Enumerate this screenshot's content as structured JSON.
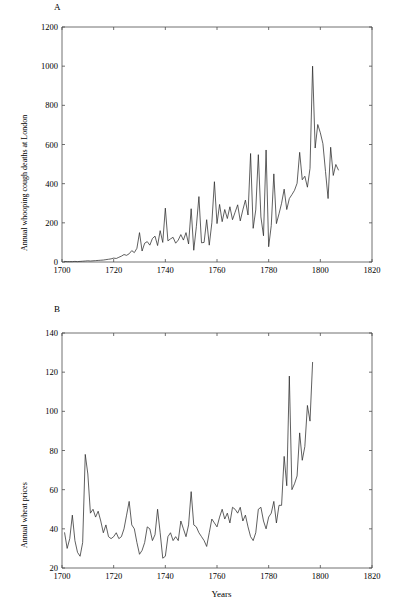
{
  "figure": {
    "background": "#ffffff",
    "line_color": "#2b2b2b",
    "axis_color": "#4d4d4d"
  },
  "panels": {
    "a": {
      "letter": "A"
    },
    "b": {
      "letter": "B"
    }
  },
  "chart_data": [
    {
      "type": "line",
      "panel": "A",
      "title": "",
      "xlabel": "",
      "ylabel": "Annual whooping cough deaths at London",
      "xlim": [
        1700,
        1820
      ],
      "ylim": [
        0,
        1200
      ],
      "xticks": [
        1700,
        1720,
        1740,
        1760,
        1780,
        1800,
        1820
      ],
      "yticks": [
        0,
        200,
        400,
        600,
        800,
        1000,
        1200
      ],
      "grid": false,
      "legend": "none",
      "x": [
        1701,
        1702,
        1703,
        1704,
        1705,
        1706,
        1707,
        1708,
        1709,
        1710,
        1711,
        1712,
        1713,
        1714,
        1715,
        1716,
        1717,
        1718,
        1719,
        1720,
        1721,
        1722,
        1723,
        1724,
        1725,
        1726,
        1727,
        1728,
        1729,
        1730,
        1731,
        1732,
        1733,
        1734,
        1735,
        1736,
        1737,
        1738,
        1739,
        1740,
        1741,
        1742,
        1743,
        1744,
        1745,
        1746,
        1747,
        1748,
        1749,
        1750,
        1751,
        1752,
        1753,
        1754,
        1755,
        1756,
        1757,
        1758,
        1759,
        1760,
        1761,
        1762,
        1763,
        1764,
        1765,
        1766,
        1767,
        1768,
        1769,
        1770,
        1771,
        1772,
        1773,
        1774,
        1775,
        1776,
        1777,
        1778,
        1779,
        1780,
        1781,
        1782,
        1783,
        1784,
        1785,
        1786,
        1787,
        1788,
        1789,
        1790,
        1791,
        1792,
        1793,
        1794,
        1795,
        1796,
        1797,
        1798,
        1799,
        1800,
        1801,
        1802,
        1803,
        1804,
        1805,
        1806,
        1807,
        1808,
        1809,
        1810,
        1811,
        1812
      ],
      "y": [
        3,
        2,
        2,
        2,
        3,
        2,
        3,
        4,
        5,
        6,
        5,
        6,
        7,
        8,
        9,
        10,
        12,
        14,
        16,
        20,
        18,
        24,
        30,
        38,
        34,
        42,
        58,
        48,
        70,
        150,
        56,
        96,
        104,
        86,
        120,
        132,
        84,
        160,
        100,
        275,
        108,
        118,
        126,
        96,
        112,
        140,
        112,
        150,
        92,
        272,
        60,
        180,
        334,
        98,
        100,
        216,
        86,
        200,
        410,
        196,
        294,
        206,
        268,
        222,
        282,
        216,
        254,
        292,
        210,
        266,
        316,
        240,
        554,
        172,
        266,
        548,
        230,
        134,
        572,
        78,
        186,
        450,
        196,
        246,
        300,
        372,
        268,
        324,
        344,
        366,
        402,
        560,
        420,
        438,
        382,
        478,
        1000,
        582,
        702,
        660,
        604,
        462,
        324,
        586,
        442,
        498,
        470,
        0,
        0,
        0,
        0,
        0
      ]
    },
    {
      "type": "line",
      "panel": "B",
      "title": "",
      "xlabel": "Years",
      "ylabel": "Annual wheat prices",
      "xlim": [
        1700,
        1820
      ],
      "ylim": [
        20,
        140
      ],
      "xticks": [
        1700,
        1720,
        1740,
        1760,
        1780,
        1800,
        1820
      ],
      "yticks": [
        20,
        40,
        60,
        80,
        100,
        120,
        140
      ],
      "grid": false,
      "legend": "none",
      "x": [
        1701,
        1702,
        1703,
        1704,
        1705,
        1706,
        1707,
        1708,
        1709,
        1710,
        1711,
        1712,
        1713,
        1714,
        1715,
        1716,
        1717,
        1718,
        1719,
        1720,
        1721,
        1722,
        1723,
        1724,
        1725,
        1726,
        1727,
        1728,
        1729,
        1730,
        1731,
        1732,
        1733,
        1734,
        1735,
        1736,
        1737,
        1738,
        1739,
        1740,
        1741,
        1742,
        1743,
        1744,
        1745,
        1746,
        1747,
        1748,
        1749,
        1750,
        1751,
        1752,
        1753,
        1754,
        1755,
        1756,
        1757,
        1758,
        1759,
        1760,
        1761,
        1762,
        1763,
        1764,
        1765,
        1766,
        1767,
        1768,
        1769,
        1770,
        1771,
        1772,
        1773,
        1774,
        1775,
        1776,
        1777,
        1778,
        1779,
        1780,
        1781,
        1782,
        1783,
        1784,
        1785,
        1786,
        1787,
        1788,
        1789,
        1790,
        1791,
        1792,
        1793,
        1794,
        1795,
        1796,
        1797,
        1798,
        1799,
        1800,
        1801,
        1802,
        1803,
        1804,
        1805,
        1806,
        1807,
        1808,
        1809,
        1810,
        1811,
        1812
      ],
      "y": [
        38,
        30,
        35,
        47,
        34,
        28,
        26,
        33,
        78,
        68,
        48,
        50,
        46,
        49,
        44,
        38,
        42,
        36,
        35,
        36,
        38,
        35,
        36,
        40,
        47,
        54,
        42,
        40,
        33,
        27,
        29,
        33,
        41,
        40,
        34,
        37,
        50,
        38,
        25,
        26,
        36,
        38,
        34,
        36,
        34,
        44,
        40,
        36,
        42,
        59,
        42,
        41,
        38,
        36,
        34,
        31,
        38,
        45,
        43,
        41,
        46,
        50,
        45,
        48,
        43,
        51,
        50,
        48,
        51,
        44,
        47,
        41,
        36,
        34,
        38,
        50,
        51,
        44,
        40,
        46,
        48,
        54,
        43,
        52,
        52,
        77,
        62,
        118,
        60,
        63,
        67,
        89,
        75,
        82,
        103,
        95,
        125,
        0,
        0,
        0,
        0,
        0,
        0,
        0,
        0,
        0,
        0,
        0,
        0,
        0,
        0,
        0
      ]
    }
  ]
}
